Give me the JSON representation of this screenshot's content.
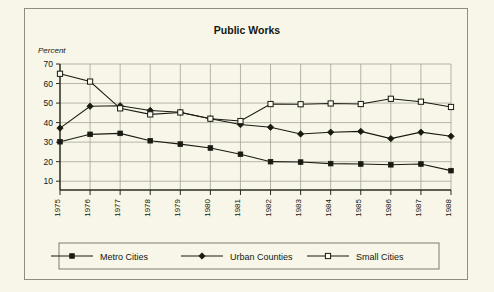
{
  "chart_data": {
    "type": "line",
    "title": "Public Works",
    "ylabel": "Percent",
    "xlabel": "",
    "ylim": [
      0,
      70
    ],
    "yticks": [
      10,
      20,
      30,
      40,
      50,
      60,
      70
    ],
    "grid": true,
    "legend_position": "bottom",
    "categories": [
      "1975",
      "1976",
      "1977",
      "1978",
      "1979",
      "1980",
      "1981",
      "1982",
      "1983",
      "1984",
      "1985",
      "1986",
      "1987",
      "1988"
    ],
    "series": [
      {
        "name": "Metro Cities",
        "marker": "filled-square",
        "values": [
          30.2,
          34.0,
          34.5,
          30.7,
          29.0,
          27.0,
          23.8,
          20.0,
          19.8,
          19.0,
          18.8,
          18.4,
          18.8,
          15.4
        ]
      },
      {
        "name": "Urban Counties",
        "marker": "filled-diamond",
        "values": [
          37.2,
          48.4,
          48.6,
          46.2,
          45.3,
          42.0,
          39.0,
          37.6,
          34.2,
          35.1,
          35.5,
          31.8,
          35.1,
          33.0
        ]
      },
      {
        "name": "Small Cities",
        "marker": "open-square",
        "values": [
          65.0,
          61.0,
          47.3,
          44.2,
          45.2,
          42.0,
          40.8,
          49.5,
          49.4,
          49.8,
          49.5,
          52.2,
          50.7,
          48.0
        ]
      }
    ]
  },
  "colors": {
    "background": "#f7f6e8",
    "ink": "#1a1a12",
    "gridline": "#9a9a8c",
    "frame": "#8d8d80"
  }
}
